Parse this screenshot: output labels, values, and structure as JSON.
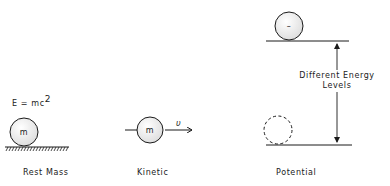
{
  "diagram": {
    "rest_mass": {
      "equation": "E = mc",
      "exponent": "2",
      "mass_label": "m",
      "caption": "Rest Mass"
    },
    "kinetic": {
      "mass_label": "m",
      "velocity_label": "υ",
      "caption": "Kinetic"
    },
    "potential": {
      "top_ball_label": "–",
      "arrow_label_line1": "Different Energy",
      "arrow_label_line2": "Levels",
      "caption": "Potential"
    },
    "colors": {
      "ink": "#1a1a1a",
      "ball_fill": "#ececec"
    }
  }
}
